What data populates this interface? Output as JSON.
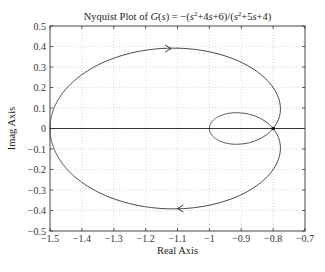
{
  "chart_data": {
    "type": "line",
    "transfer_function": {
      "numerator": [
        1,
        4,
        6
      ],
      "denominator": [
        1,
        5,
        4
      ],
      "gain": -1
    },
    "xlabel": "Real Axis",
    "ylabel": "Imag Axis",
    "xlim": [
      -1.5,
      -0.7
    ],
    "ylim": [
      -0.5,
      0.5
    ],
    "xticks": [
      -1.5,
      -1.4,
      -1.3,
      -1.2,
      -1.1,
      -1,
      -0.9,
      -0.8,
      -0.7
    ],
    "xtick_labels": [
      "−1.5",
      "−1.4",
      "−1.3",
      "−1.2",
      "−1.1",
      "−1",
      "−0.9",
      "−0.8",
      "−0.7"
    ],
    "yticks": [
      0.5,
      0.4,
      0.3,
      0.2,
      0.1,
      0,
      -0.1,
      -0.2,
      -0.3,
      -0.4,
      -0.5
    ],
    "ytick_labels": [
      "0.5",
      "0.4",
      "0.3",
      "0.2",
      "0.1",
      "0",
      "−0.1",
      "−0.2",
      "−0.3",
      "−0.4",
      "−0.5"
    ],
    "grid": true,
    "series": [
      {
        "name": "G(jω), ω > 0",
        "points": [
          {
            "omega": 0,
            "re": -1.5,
            "im": 0
          },
          {
            "omega": 0.5,
            "re": -1.3077,
            "im": 0.3385
          },
          {
            "omega": 1,
            "re": -1.0294,
            "im": 0.3824
          },
          {
            "omega": 2,
            "re": -0.8,
            "im": 0.2
          },
          {
            "omega": 3.742,
            "re": -0.8,
            "im": 0
          },
          {
            "omega": 6,
            "re": -0.873,
            "im": -0.0686
          },
          {
            "omega": "inf",
            "re": -1,
            "im": 0
          }
        ]
      },
      {
        "name": "G(jω), ω < 0 (mirror)",
        "points": [
          {
            "omega": "-inf",
            "re": -1,
            "im": 0
          },
          {
            "omega": -6,
            "re": -0.873,
            "im": 0.0686
          },
          {
            "omega": -3.742,
            "re": -0.8,
            "im": 0
          },
          {
            "omega": -2,
            "re": -0.8,
            "im": -0.2
          },
          {
            "omega": -1,
            "re": -1.0294,
            "im": -0.3824
          },
          {
            "omega": -0.5,
            "re": -1.3077,
            "im": -0.3385
          },
          {
            "omega": 0,
            "re": -1.5,
            "im": 0
          }
        ]
      }
    ],
    "annotations": [
      {
        "type": "arrow",
        "re": -1.12,
        "im": 0.39,
        "direction": "right"
      },
      {
        "type": "arrow",
        "re": -1.1,
        "im": -0.39,
        "direction": "left"
      },
      {
        "type": "marker",
        "re": -0.8,
        "im": 0
      }
    ],
    "legend": null
  }
}
